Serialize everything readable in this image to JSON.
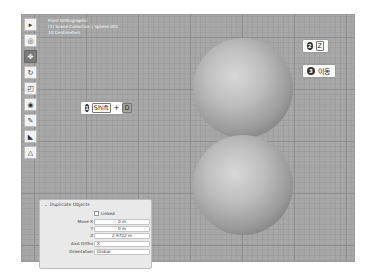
{
  "viewport": {
    "info_lines": [
      "Front Orthographic",
      "(1) Scene Collection | Sphere.001",
      "10 Centimeters"
    ]
  },
  "toolbar": {
    "tools": [
      {
        "name": "select-tool",
        "glyph": "▸",
        "active": false
      },
      {
        "name": "cursor-tool",
        "glyph": "◎",
        "active": false
      },
      {
        "name": "move-tool",
        "glyph": "✥",
        "active": true
      },
      {
        "name": "rotate-tool",
        "glyph": "↻",
        "active": false
      },
      {
        "name": "scale-tool",
        "glyph": "◰",
        "active": false
      },
      {
        "name": "transform-tool",
        "glyph": "◉",
        "active": false
      },
      {
        "name": "annotate-tool",
        "glyph": "✎",
        "active": false
      },
      {
        "name": "measure-tool",
        "glyph": "◣",
        "active": false
      },
      {
        "name": "add-object-tool",
        "glyph": "△",
        "active": false
      }
    ]
  },
  "callouts": [
    {
      "num": "1",
      "keys": [
        "Shift",
        "D"
      ],
      "sep": "+"
    },
    {
      "num": "2",
      "keys": [
        "Z"
      ]
    },
    {
      "num": "3",
      "text": "이동"
    }
  ],
  "panel": {
    "title": "Duplicate Objects",
    "linked_label": "Linked",
    "move_x_label": "Move X",
    "move_x": "0 m",
    "y_label": "Y",
    "y": "0 m",
    "z_label": "Z",
    "z": "2.9722 m",
    "axis_ortho_label": "Axis Ortho",
    "axis_ortho": "X",
    "orientation_label": "Orientation",
    "orientation": "Global"
  }
}
